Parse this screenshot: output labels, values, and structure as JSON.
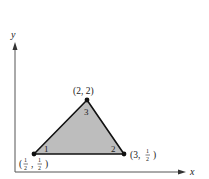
{
  "diagram": {
    "type": "triangle-element",
    "axes": {
      "x_label": "x",
      "y_label": "y"
    },
    "vertices": [
      {
        "local_number": "1",
        "coord_label_parts": [
          "(",
          "1",
          "2",
          ",",
          "1",
          "2",
          ")"
        ],
        "coord_label": "(1/2, 1/2)",
        "x": 0.5,
        "y": 0.5
      },
      {
        "local_number": "2",
        "coord_label": "(3, 1/2)",
        "x": 3,
        "y": 0.5
      },
      {
        "local_number": "3",
        "coord_label": "(2, 2)",
        "x": 2,
        "y": 2
      }
    ],
    "labels": {
      "v1_open": "(",
      "v1_num1": "1",
      "v1_den1": "2",
      "v1_sep": ",",
      "v1_num2": "1",
      "v1_den2": "2",
      "v1_close": ")",
      "v2_prefix": "(3,",
      "v2_num": "1",
      "v2_den": "2",
      "v2_close": ")",
      "v3": "(2, 2)",
      "n1": "1",
      "n2": "2",
      "n3": "3"
    },
    "colors": {
      "fill": "#bdbdbd",
      "stroke": "#111111",
      "axis": "#444444"
    }
  }
}
